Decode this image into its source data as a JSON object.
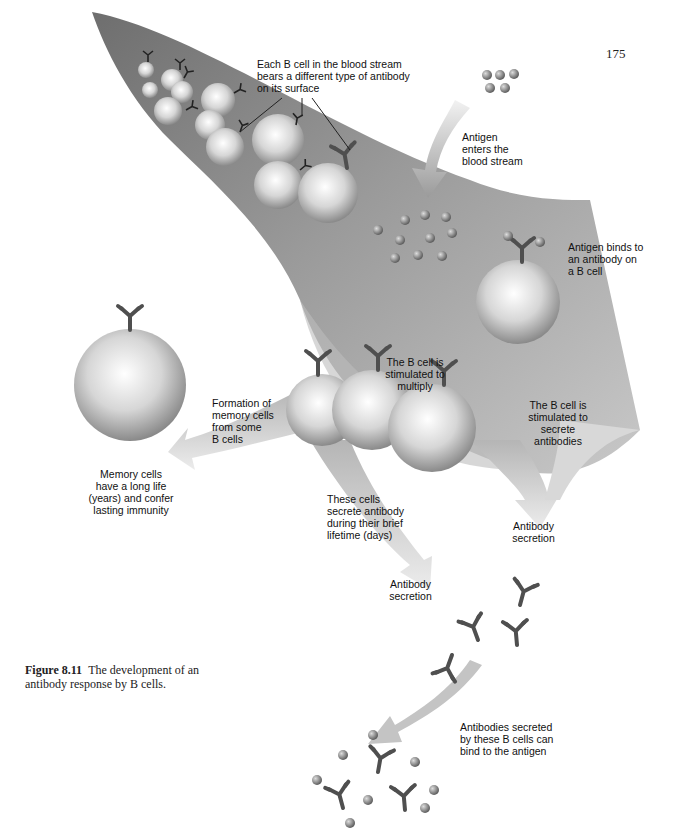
{
  "page": {
    "number": "175"
  },
  "figure": {
    "number": "Figure 8.11",
    "caption": "The development of an antibody response by B cells."
  },
  "labels": {
    "b_cells_bloodstream": "Each B cell in the blood stream\nbears a different type of antibody\non its surface",
    "antigen_enters": "Antigen\nenters the\nblood stream",
    "antigen_binds": "Antigen binds to\nan antibody on\na B cell",
    "stimulated_multiply": "The B cell is\nstimulated to\nmultiply",
    "stimulated_secrete": "The B cell is\nstimulated to\nsecrete\nantibodies",
    "memory_formation": "Formation of\nmemory cells\nfrom some\nB cells",
    "memory_cells": "Memory cells\nhave a long life\n(years) and confer\nlasting immunity",
    "brief_lifetime": "These cells\nsecrete antibody\nduring their brief\nlifetime (days)",
    "antibody_secretion_right": "Antibody\nsecretion",
    "antibody_secretion_center": "Antibody\nsecretion",
    "antibodies_bind": "Antibodies secreted\nby these B cells can\nbind to the antigen"
  },
  "colors": {
    "stream_dark": "#7a7a7a",
    "stream_light": "#dcdcdc",
    "cell_light": "#f2f2f2",
    "cell_dark": "#8e8e8e",
    "antibody": "#555555",
    "antigen": "#888888",
    "text": "#111111"
  }
}
